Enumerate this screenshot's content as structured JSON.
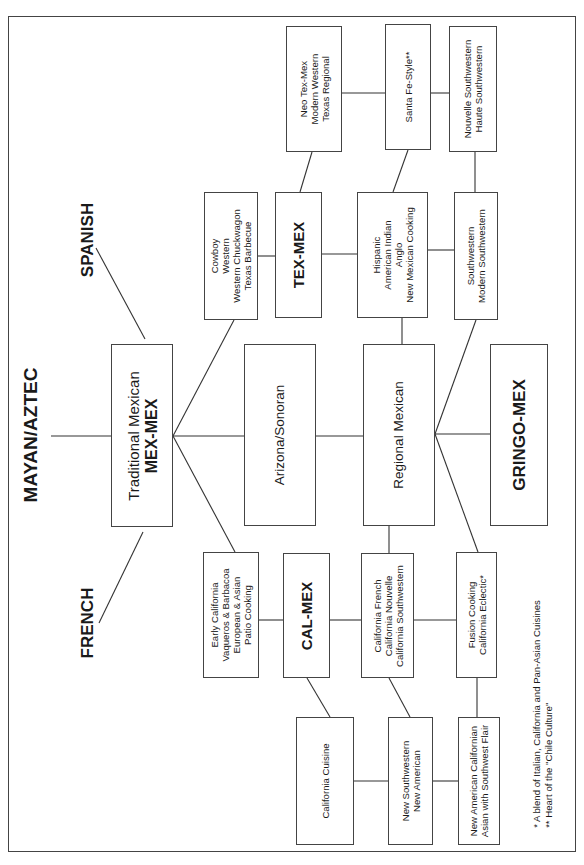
{
  "diagram": {
    "orientation": "rotated-90-ccw",
    "root": {
      "label": "MAYAN/AZTEC"
    },
    "influences": [
      {
        "label": "SPANISH"
      },
      {
        "label": "FRENCH"
      }
    ],
    "nodes": {
      "traditional": {
        "lines": [
          "Traditional Mexican",
          "MEX-MEX"
        ]
      },
      "arizona": {
        "lines": [
          "Arizona/Sonoran"
        ]
      },
      "regional": {
        "lines": [
          "Regional Mexican"
        ]
      },
      "gringo": {
        "lines": [
          "GRINGO-MEX"
        ]
      },
      "cowboy": {
        "lines": [
          "Cowboy",
          "Western",
          "Western Chuckwagon",
          "Texas Barbecue"
        ]
      },
      "texmex": {
        "lines": [
          "TEX-MEX"
        ]
      },
      "neo_texmex": {
        "lines": [
          "Neo Tex-Mex",
          "Modern Western",
          "Texas Regional"
        ]
      },
      "hispanic": {
        "lines": [
          "Hispanic",
          "American Indian",
          "Anglo",
          "New Mexican Cooking"
        ]
      },
      "santa_fe": {
        "lines": [
          "Santa Fe-Style**"
        ]
      },
      "southwestern": {
        "lines": [
          "Southwestern",
          "Modern Southwestern"
        ]
      },
      "nouvelle": {
        "lines": [
          "Nouvelle Southwestern",
          "Haute Southwestern"
        ]
      },
      "early_california": {
        "lines": [
          "Early California",
          "Vaqueros & Barbacoa",
          "European & Asian",
          "Patio Cooking"
        ]
      },
      "calmex": {
        "lines": [
          "CAL-MEX"
        ]
      },
      "california_french": {
        "lines": [
          "California French",
          "California Nouvelle",
          "California Southwestern"
        ]
      },
      "fusion": {
        "lines": [
          "Fusion Cooking",
          "California Eclectic*"
        ]
      },
      "california_cuisine": {
        "lines": [
          "California Cuisine"
        ]
      },
      "new_southwestern": {
        "lines": [
          "New Southwestern",
          "New American"
        ]
      },
      "new_american_californian": {
        "lines": [
          "New American Californian",
          "Asian with Southwest Flair"
        ]
      }
    },
    "footnotes": [
      "* A blend of Italian, California and Pan-Asian Cuisines",
      "** Heart of the \"Chile Culture\""
    ]
  },
  "colors": {
    "line": "#333333",
    "border": "#444444",
    "background": "#ffffff",
    "text": "#1a1a1a"
  }
}
